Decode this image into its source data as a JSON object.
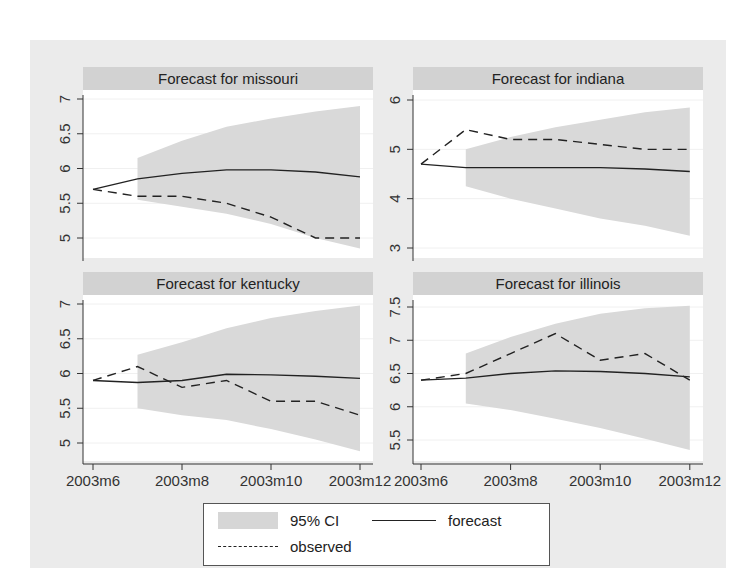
{
  "chart_data": [
    {
      "type": "line",
      "title": "Forecast for missouri",
      "x": [
        "2003m6",
        "2003m7",
        "2003m8",
        "2003m9",
        "2003m10",
        "2003m11",
        "2003m12"
      ],
      "xticks": [
        "2003m6",
        "2003m8",
        "2003m10",
        "2003m12"
      ],
      "yticks": [
        5,
        5.5,
        6,
        6.5,
        7
      ],
      "ylim": [
        4.8,
        7.2
      ],
      "series": [
        {
          "name": "observed",
          "style": "dashed",
          "values": [
            5.7,
            5.6,
            5.6,
            5.5,
            5.3,
            5.0,
            5.0
          ]
        },
        {
          "name": "forecast",
          "style": "solid",
          "values": [
            5.7,
            5.85,
            5.93,
            5.98,
            5.98,
            5.95,
            5.88
          ]
        },
        {
          "name": "95% CI upper",
          "style": "area",
          "values": [
            null,
            6.15,
            6.4,
            6.6,
            6.72,
            6.82,
            6.9
          ]
        },
        {
          "name": "95% CI lower",
          "style": "area",
          "values": [
            null,
            5.55,
            5.45,
            5.35,
            5.2,
            5.0,
            4.85
          ]
        }
      ]
    },
    {
      "type": "line",
      "title": "Forecast for indiana",
      "x": [
        "2003m6",
        "2003m7",
        "2003m8",
        "2003m9",
        "2003m10",
        "2003m11",
        "2003m12"
      ],
      "xticks": [
        "2003m6",
        "2003m8",
        "2003m10",
        "2003m12"
      ],
      "yticks": [
        3,
        4,
        5,
        6
      ],
      "ylim": [
        2.8,
        6.2
      ],
      "series": [
        {
          "name": "observed",
          "style": "dashed",
          "values": [
            4.7,
            5.4,
            5.2,
            5.2,
            5.1,
            5.0,
            5.0
          ]
        },
        {
          "name": "forecast",
          "style": "solid",
          "values": [
            4.7,
            4.63,
            4.63,
            4.63,
            4.63,
            4.6,
            4.55
          ]
        },
        {
          "name": "95% CI upper",
          "style": "area",
          "values": [
            null,
            5.0,
            5.25,
            5.45,
            5.6,
            5.75,
            5.85
          ]
        },
        {
          "name": "95% CI lower",
          "style": "area",
          "values": [
            null,
            4.25,
            4.0,
            3.8,
            3.6,
            3.45,
            3.25
          ]
        }
      ]
    },
    {
      "type": "line",
      "title": "Forecast for kentucky",
      "x": [
        "2003m6",
        "2003m7",
        "2003m8",
        "2003m9",
        "2003m10",
        "2003m11",
        "2003m12"
      ],
      "xticks": [
        "2003m6",
        "2003m8",
        "2003m10",
        "2003m12"
      ],
      "yticks": [
        5,
        5.5,
        6,
        6.5,
        7
      ],
      "ylim": [
        4.75,
        7.15
      ],
      "series": [
        {
          "name": "observed",
          "style": "dashed",
          "values": [
            5.9,
            6.1,
            5.8,
            5.9,
            5.6,
            5.6,
            5.4
          ]
        },
        {
          "name": "forecast",
          "style": "solid",
          "values": [
            5.9,
            5.87,
            5.9,
            5.99,
            5.98,
            5.96,
            5.93
          ]
        },
        {
          "name": "95% CI upper",
          "style": "area",
          "values": [
            null,
            6.27,
            6.45,
            6.65,
            6.8,
            6.9,
            6.98
          ]
        },
        {
          "name": "95% CI lower",
          "style": "area",
          "values": [
            null,
            5.5,
            5.4,
            5.33,
            5.2,
            5.05,
            4.88
          ]
        }
      ]
    },
    {
      "type": "line",
      "title": "Forecast for illinois",
      "x": [
        "2003m6",
        "2003m7",
        "2003m8",
        "2003m9",
        "2003m10",
        "2003m11",
        "2003m12"
      ],
      "xticks": [
        "2003m6",
        "2003m8",
        "2003m10",
        "2003m12"
      ],
      "yticks": [
        5.5,
        6,
        6.5,
        7,
        7.5
      ],
      "ylim": [
        5.3,
        7.6
      ],
      "series": [
        {
          "name": "observed",
          "style": "dashed",
          "values": [
            6.4,
            6.5,
            6.8,
            7.1,
            6.7,
            6.8,
            6.4
          ]
        },
        {
          "name": "forecast",
          "style": "solid",
          "values": [
            6.4,
            6.43,
            6.5,
            6.54,
            6.53,
            6.5,
            6.45
          ]
        },
        {
          "name": "95% CI upper",
          "style": "area",
          "values": [
            null,
            6.8,
            7.05,
            7.25,
            7.4,
            7.48,
            7.52
          ]
        },
        {
          "name": "95% CI lower",
          "style": "area",
          "values": [
            null,
            6.05,
            5.95,
            5.82,
            5.68,
            5.52,
            5.35
          ]
        }
      ]
    }
  ],
  "legend": {
    "ci_label": "95% CI",
    "forecast_label": "forecast",
    "observed_label": "observed"
  },
  "colors": {
    "figure_bg": "#ebebeb",
    "title_bar": "#d2d2d2",
    "ci_fill": "#d9d9d9",
    "line": "#222222"
  }
}
